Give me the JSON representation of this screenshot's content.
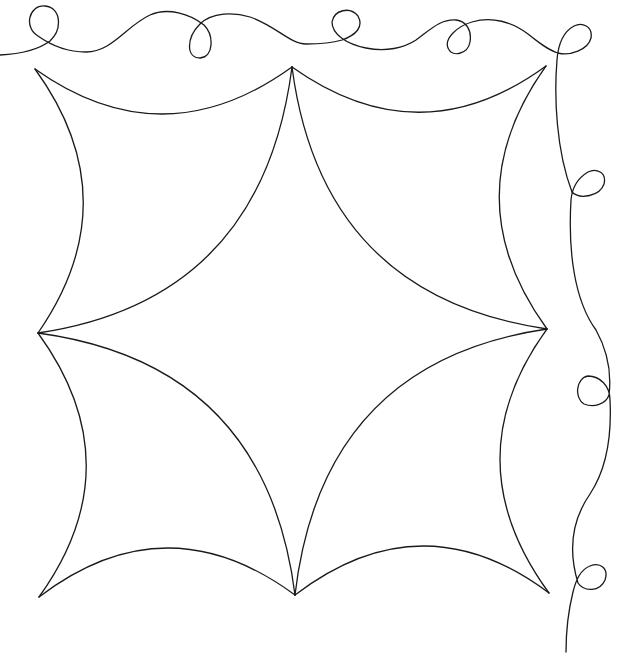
{
  "figure": {
    "type": "quilting-pattern-line-drawing",
    "stroke_color": "#1a1a1a",
    "background": "#ffffff",
    "motif": {
      "name": "curved-star-block",
      "points": {
        "top_left": [
          35,
          69
        ],
        "top_center": [
          292,
          67
        ],
        "top_right": [
          546,
          66
        ],
        "mid_left": [
          38,
          333
        ],
        "mid_right": [
          547,
          329
        ],
        "bottom_left": [
          39,
          597
        ],
        "bottom_center": [
          295,
          595
        ],
        "bottom_right": [
          549,
          593
        ]
      }
    },
    "border": {
      "name": "loop-meander-border",
      "top_loops": [
        [
          44,
          22
        ],
        [
          200,
          43
        ],
        [
          347,
          25
        ],
        [
          464,
          40
        ],
        [
          578,
          38
        ]
      ],
      "right_loops": [
        [
          590,
          184
        ],
        [
          592,
          390
        ],
        [
          592,
          578
        ]
      ]
    },
    "caption": ""
  }
}
